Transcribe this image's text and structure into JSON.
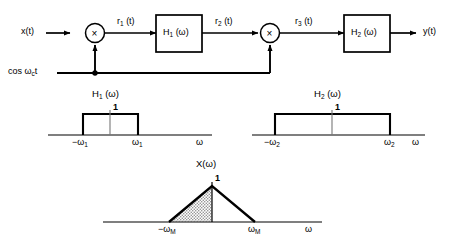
{
  "diagram": {
    "block_chain": {
      "input_label": "x(t)",
      "output_label": "y(t)",
      "carrier_label_prefix": "cos ",
      "carrier_label_omega": "ω",
      "carrier_label_sub": "c",
      "carrier_label_suffix": "t",
      "mixer1_symbol": "×",
      "mixer2_symbol": "×",
      "filter1_label": "H",
      "filter1_sub": "1",
      "filter1_arg": " (ω)",
      "filter2_label": "H",
      "filter2_sub": "2",
      "filter2_arg": " (ω)",
      "signal1_label": "r",
      "signal1_sub": "1",
      "signal1_arg": " (t)",
      "signal2_label": "r",
      "signal2_sub": "2",
      "signal2_arg": " (t)",
      "signal3_label": "r",
      "signal3_sub": "3",
      "signal3_arg": " (t)"
    },
    "plots": [
      {
        "id": "h1",
        "title_base": "H",
        "title_sub": "1",
        "title_arg": " (ω)",
        "peak_value": "1",
        "left_tick": "−ω",
        "left_tick_sub": "1",
        "right_tick": "ω",
        "right_tick_sub": "1",
        "axis_label": "ω",
        "shape": "rectangle",
        "shaded": false
      },
      {
        "id": "h2",
        "title_base": "H",
        "title_sub": "2",
        "title_arg": " (ω)",
        "peak_value": "1",
        "left_tick": "−ω",
        "left_tick_sub": "2",
        "right_tick": "ω",
        "right_tick_sub": "2",
        "axis_label": "ω",
        "shape": "rectangle",
        "shaded": false
      },
      {
        "id": "x",
        "title_base": "X",
        "title_sub": "",
        "title_arg": "(ω)",
        "peak_value": "1",
        "left_tick": "−ω",
        "left_tick_sub": "M",
        "right_tick": "ω",
        "right_tick_sub": "M",
        "axis_label": "ω",
        "shape": "triangle",
        "shaded": true
      }
    ]
  },
  "colors": {
    "ink": "#000000",
    "paper": "#ffffff",
    "axis": "#555555",
    "shade": "#b9b9b9"
  }
}
